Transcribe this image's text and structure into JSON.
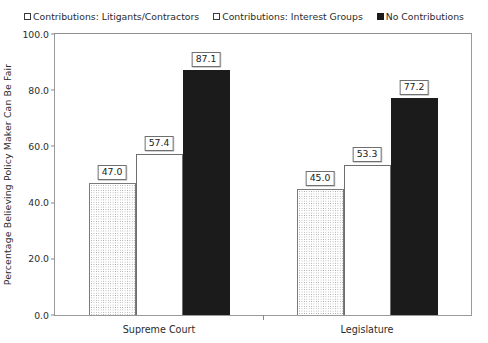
{
  "chart_data": {
    "type": "bar",
    "title": "",
    "subtitle": "",
    "xlabel": "",
    "ylabel": "Percentage Believing Policy Maker Can Be Fair",
    "ylim": [
      0.0,
      100.0
    ],
    "ytick_step": 20.0,
    "ytick_labels": [
      "0.0",
      "20.0",
      "40.0",
      "60.0",
      "80.0",
      "100.0"
    ],
    "ytick_values": [
      0.0,
      20.0,
      40.0,
      60.0,
      80.0,
      100.0
    ],
    "grid": false,
    "legend_position": "top-center",
    "categories": [
      "Supreme Court",
      "Legislature"
    ],
    "series": [
      {
        "name": "Contributions: Litigants/Contractors",
        "marker": "dotted-square",
        "fill": "dotted",
        "values": [
          47.0,
          45.0
        ],
        "labels": [
          "47.0",
          "45.0"
        ]
      },
      {
        "name": "Contributions: Interest Groups",
        "marker": "open-square",
        "fill": "open",
        "values": [
          57.4,
          53.3
        ],
        "labels": [
          "57.4",
          "53.3"
        ]
      },
      {
        "name": "No Contributions",
        "marker": "filled-square",
        "fill": "solid",
        "values": [
          87.1,
          77.2
        ],
        "labels": [
          "87.1",
          "77.2"
        ]
      }
    ],
    "colors": {
      "axis": "#9a9a9a",
      "text": "#2b2b2b",
      "solid_fill": "#1b1b1b",
      "open_fill": "#ffffff",
      "dot_fill": "#9b9b9b",
      "bar_outline": "#6e6e6e",
      "background": "#ffffff"
    }
  },
  "legend": {
    "items": [
      {
        "label": "Contributions: Litigants/Contractors"
      },
      {
        "label": "Contributions: Interest Groups"
      },
      {
        "label": "No Contributions"
      }
    ]
  }
}
